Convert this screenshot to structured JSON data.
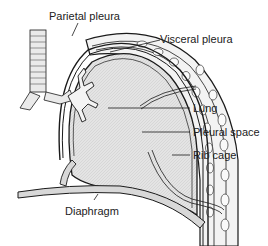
{
  "diagram": {
    "type": "anatomy-cross-section",
    "labels": [
      {
        "id": "parietal",
        "text": "Parietal pleura"
      },
      {
        "id": "visceral",
        "text": "Visceral pleura"
      },
      {
        "id": "lung",
        "text": "Lung"
      },
      {
        "id": "pleural_space",
        "text": "Pleural space"
      },
      {
        "id": "rib_cage",
        "text": "Rib cage"
      },
      {
        "id": "diaphragm",
        "text": "Diaphragm"
      }
    ],
    "colors": {
      "lung_fill": "#e2e2e2",
      "outline": "#1a1a1a",
      "rib_fill": "#f2f2f2",
      "background": "#ffffff"
    }
  }
}
